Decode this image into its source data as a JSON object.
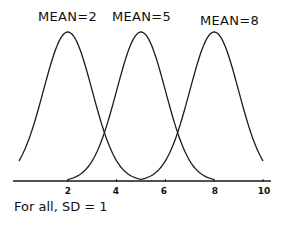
{
  "chart_data": {
    "type": "line",
    "title": "",
    "xlabel": "",
    "ylabel": "",
    "xlim": [
      0,
      10
    ],
    "xticks": [
      2,
      4,
      6,
      8,
      10
    ],
    "grid": false,
    "legend": "labels above peaks",
    "series": [
      {
        "name": "MEAN=2",
        "mean": 2,
        "sd": 1,
        "x_range": [
          0,
          5
        ]
      },
      {
        "name": "MEAN=5",
        "mean": 5,
        "sd": 1,
        "x_range": [
          2,
          8
        ]
      },
      {
        "name": "MEAN=8",
        "mean": 8,
        "sd": 1,
        "x_range": [
          5,
          10
        ]
      }
    ],
    "annotation": "For all, SD = 1"
  },
  "labels": {
    "series": [
      "MEAN=2",
      "MEAN=5",
      "MEAN=8"
    ],
    "ticks": [
      "2",
      "4",
      "6",
      "8",
      "10"
    ],
    "footnote": "For all, SD = 1"
  },
  "style": {
    "line_color": "#1a1a1a",
    "axis_color": "#1a1a1a",
    "background": "#ffffff"
  }
}
